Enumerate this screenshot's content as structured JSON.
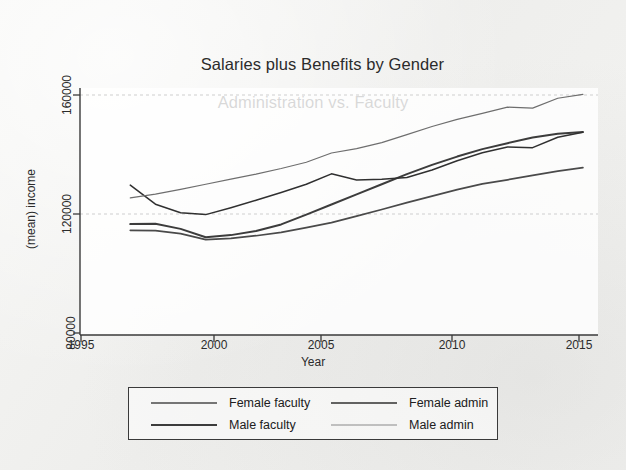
{
  "figure": {
    "title_line1": "Salaries plus Benefits by Gender",
    "title_line2": "Administration vs. Faculty"
  },
  "chart_data": {
    "type": "line",
    "title": "Salaries plus Benefits by Gender Administration vs. Faculty",
    "xlabel": "Year",
    "ylabel": "(mean) income",
    "xlim": [
      1995,
      2015.6
    ],
    "ylim": [
      80000,
      168000
    ],
    "xticks": [
      1995,
      2000,
      2005,
      2010,
      2015
    ],
    "xtick_labels": [
      "1995",
      "2000",
      "2005",
      "2010",
      "2015"
    ],
    "yticks": [
      80000,
      120000,
      160000
    ],
    "ytick_labels": [
      "80000",
      "120000",
      "160000"
    ],
    "grid": "horizontal",
    "legend_position": "below-center",
    "x": [
      1997,
      1998,
      1999,
      2000,
      2001,
      2002,
      2003,
      2004,
      2005,
      2006,
      2007,
      2008,
      2009,
      2010,
      2011,
      2012,
      2013,
      2014,
      2015
    ],
    "series": [
      {
        "name": "Female faculty",
        "color": "#4a4a4a",
        "values": [
          114500,
          114400,
          113400,
          111400,
          111800,
          112700,
          113800,
          115400,
          117100,
          119300,
          121500,
          123800,
          126000,
          128200,
          130100,
          131500,
          133000,
          134400,
          135600
        ]
      },
      {
        "name": "Male faculty",
        "color": "#3c3c3c",
        "values": [
          116600,
          116700,
          115000,
          112200,
          112900,
          114300,
          116500,
          119800,
          123200,
          126600,
          130000,
          133400,
          136500,
          139300,
          141800,
          143800,
          145700,
          147000,
          147600
        ]
      },
      {
        "name": "Female admin",
        "color": "#303030",
        "values": [
          129700,
          123300,
          120400,
          119800,
          122100,
          124600,
          127200,
          130000,
          133500,
          131400,
          131700,
          132300,
          134800,
          137900,
          140600,
          142500,
          142300,
          145800,
          147500
        ]
      },
      {
        "name": "Male admin",
        "color": "#6e6e6e",
        "values": [
          125400,
          126700,
          128300,
          130000,
          131700,
          133400,
          135300,
          137400,
          140500,
          142000,
          144000,
          146700,
          149400,
          151800,
          153800,
          155900,
          155600,
          158900,
          160200
        ]
      }
    ]
  },
  "axes": {
    "y_title": "(mean) income",
    "x_title": "Year",
    "ytick_labels": [
      "160000",
      "120000",
      "80000"
    ],
    "xtick_labels": [
      "1995",
      "2000",
      "2005",
      "2010",
      "2015"
    ]
  },
  "legend": {
    "entries": [
      {
        "label": "Female faculty",
        "color": "#4a4a4a",
        "width": "1.6px"
      },
      {
        "label": "Female admin",
        "color": "#303030",
        "width": "1.4px"
      },
      {
        "label": "Male faculty",
        "color": "#3c3c3c",
        "width": "1.9px"
      },
      {
        "label": "Male admin",
        "color": "#6e6e6e",
        "width": "1.2px"
      }
    ]
  }
}
